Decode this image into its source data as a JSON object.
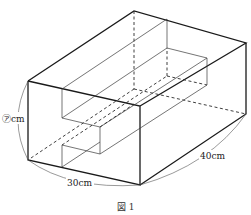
{
  "figure": {
    "caption": "図 1",
    "labels": {
      "height": "㋐cm",
      "width": "30cm",
      "depth": "40cm"
    }
  },
  "colors": {
    "line": "#1a1a1a",
    "background": "#ffffff"
  }
}
